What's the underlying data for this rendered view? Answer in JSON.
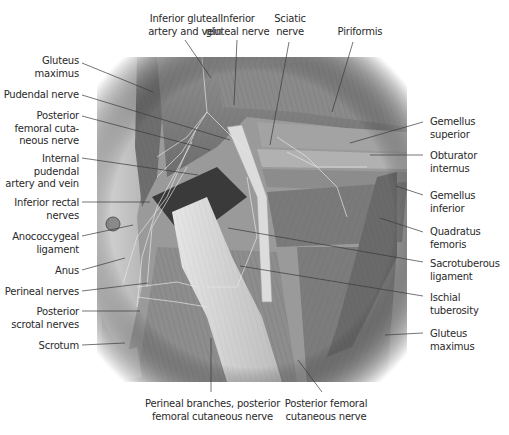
{
  "figure": {
    "colors": {
      "text": "#2a2a2a",
      "leader": "#3a3a3a",
      "background": "#ffffff",
      "illustration_tone": "grayscale"
    }
  },
  "labels": {
    "left": [
      {
        "id": "gluteus-maximus-left",
        "lines": [
          "Gluteus",
          "maximus"
        ]
      },
      {
        "id": "pudendal-nerve",
        "lines": [
          "Pudendal nerve"
        ]
      },
      {
        "id": "posterior-femoral-cutaneous-nerve-upper",
        "lines": [
          "Posterior",
          "femoral cuta-",
          "neous nerve"
        ]
      },
      {
        "id": "internal-pudendal-artery-vein",
        "lines": [
          "Internal",
          "pudendal",
          "artery and vein"
        ]
      },
      {
        "id": "inferior-rectal-nerves",
        "lines": [
          "Inferior rectal",
          "nerves"
        ]
      },
      {
        "id": "anococcygeal-ligament",
        "lines": [
          "Anococcygeal",
          "ligament"
        ]
      },
      {
        "id": "anus",
        "lines": [
          "Anus"
        ]
      },
      {
        "id": "perineal-nerves",
        "lines": [
          "Perineal nerves"
        ]
      },
      {
        "id": "posterior-scrotal-nerves",
        "lines": [
          "Posterior",
          "scrotal nerves"
        ]
      },
      {
        "id": "scrotum",
        "lines": [
          "Scrotum"
        ]
      }
    ],
    "top": [
      {
        "id": "inferior-gluteal-artery-vein",
        "lines": [
          "Inferior gluteal",
          "artery and vein"
        ]
      },
      {
        "id": "inferior-gluteal-nerve",
        "lines": [
          "Inferior",
          "gluteal nerve"
        ]
      },
      {
        "id": "sciatic-nerve",
        "lines": [
          "Sciatic",
          "nerve"
        ]
      },
      {
        "id": "piriformis",
        "lines": [
          "Piriformis"
        ]
      }
    ],
    "right": [
      {
        "id": "gemellus-superior",
        "lines": [
          "Gemellus",
          "superior"
        ]
      },
      {
        "id": "obturator-internus",
        "lines": [
          "Obturator",
          "internus"
        ]
      },
      {
        "id": "gemellus-inferior",
        "lines": [
          "Gemellus",
          "inferior"
        ]
      },
      {
        "id": "quadratus-femoris",
        "lines": [
          "Quadratus",
          "femoris"
        ]
      },
      {
        "id": "sacrotuberous-ligament",
        "lines": [
          "Sacrotuberous",
          "ligament"
        ]
      },
      {
        "id": "ischial-tuberosity",
        "lines": [
          "Ischial",
          "tuberosity"
        ]
      },
      {
        "id": "gluteus-maximus-right",
        "lines": [
          "Gluteus",
          "maximus"
        ]
      }
    ],
    "bottom": [
      {
        "id": "perineal-branches-pfcn",
        "lines": [
          "Perineal branches, posterior",
          "femoral cutaneous nerve"
        ]
      },
      {
        "id": "posterior-femoral-cutaneous-nerve-lower",
        "lines": [
          "Posterior femoral",
          "cutaneous nerve"
        ]
      }
    ]
  }
}
